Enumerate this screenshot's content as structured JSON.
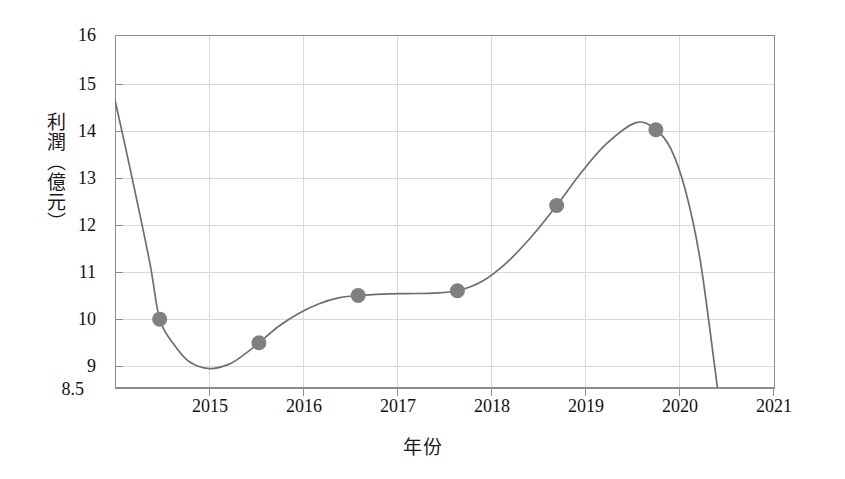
{
  "chart_data": {
    "type": "line",
    "title": "",
    "subtitle": "",
    "xlabel": "年份",
    "ylabel": "利潤（億元）",
    "xlim": [
      2014.55,
      2021.2
    ],
    "ylim": [
      8.5,
      16
    ],
    "grid": true,
    "legend": null,
    "legend_position": "none",
    "x_ticks": [
      2015,
      2016,
      2017,
      2018,
      2019,
      2020,
      2021
    ],
    "x_tick_labels": [
      "2015",
      "2016",
      "2017",
      "2018",
      "2019",
      "2020",
      "2021"
    ],
    "y_ticks": [
      8.5,
      9,
      10,
      11,
      12,
      13,
      14,
      15,
      16
    ],
    "y_tick_labels": [
      "8.5",
      "9",
      "10",
      "11",
      "12",
      "13",
      "14",
      "15",
      "16"
    ],
    "series": [
      {
        "name": "利潤",
        "marker": "circle",
        "marker_color": "#808080",
        "line_color": "#6e6e6e",
        "x": [
          2015,
          2016,
          2017,
          2018,
          2019,
          2020
        ],
        "values": [
          10.0,
          9.5,
          10.5,
          10.6,
          12.4,
          14.0
        ],
        "point_labels": [
          "10",
          "9.5",
          "10.5",
          "10.6",
          "12.4",
          "14"
        ]
      }
    ],
    "curve": {
      "description": "smooth fitted curve entering plot at top y=16 near x=2014.35, local minimum about 8.95 near x=2015.5, plateau near 10.55 between 2017 and 2018, maximum about 14.15 near x=2019.8, descending steeply past bottom edge near x=2020.6",
      "x": [
        2014.35,
        2014.5,
        2014.7,
        2014.9,
        2015.0,
        2015.15,
        2015.3,
        2015.5,
        2015.7,
        2015.85,
        2016.0,
        2016.2,
        2016.4,
        2016.6,
        2016.8,
        2017.0,
        2017.25,
        2017.5,
        2017.75,
        2018.0,
        2018.25,
        2018.5,
        2018.75,
        2019.0,
        2019.25,
        2019.5,
        2019.8,
        2020.0,
        2020.15,
        2020.3,
        2020.45,
        2020.62
      ],
      "y": [
        16.6,
        15.1,
        13.2,
        11.2,
        10.0,
        9.45,
        9.1,
        8.95,
        9.05,
        9.25,
        9.5,
        9.85,
        10.12,
        10.32,
        10.45,
        10.5,
        10.53,
        10.54,
        10.55,
        10.6,
        10.8,
        11.2,
        11.75,
        12.4,
        13.1,
        13.7,
        14.15,
        14.0,
        13.6,
        12.7,
        11.2,
        8.5
      ]
    },
    "points_annotated": [
      {
        "year": 2015,
        "profit": 10.0
      },
      {
        "year": 2016,
        "profit": 9.5
      },
      {
        "year": 2017,
        "profit": 10.5
      },
      {
        "year": 2018,
        "profit": 10.6
      },
      {
        "year": 2019,
        "profit": 12.4
      },
      {
        "year": 2020,
        "profit": 14.0
      }
    ],
    "colors": {
      "line": "#6e6e6e",
      "marker": "#808080",
      "grid": "#d9d9d9",
      "frame": "#888888",
      "text": "#111111",
      "background": "#ffffff"
    }
  }
}
